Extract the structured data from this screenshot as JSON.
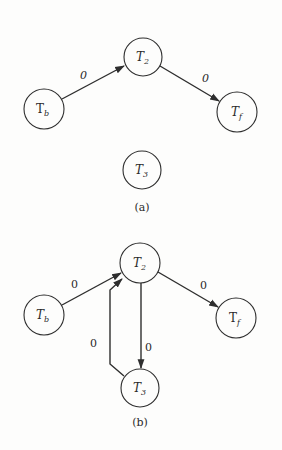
{
  "diagrams": [
    {
      "id": "a",
      "caption": "(a)",
      "nodes": [
        {
          "id": "Tb",
          "base": "T",
          "sub": "b"
        },
        {
          "id": "T2",
          "base": "T",
          "sub": "2"
        },
        {
          "id": "Tf",
          "base": "T",
          "sub": "f"
        },
        {
          "id": "T3",
          "base": "T",
          "sub": "3"
        }
      ],
      "edges": [
        {
          "from": "Tb",
          "to": "T2",
          "label": "0"
        },
        {
          "from": "T2",
          "to": "Tf",
          "label": "0"
        }
      ]
    },
    {
      "id": "b",
      "caption": "(b)",
      "nodes": [
        {
          "id": "Tb",
          "base": "T",
          "sub": "b"
        },
        {
          "id": "T2",
          "base": "T",
          "sub": "2"
        },
        {
          "id": "Tf",
          "base": "T",
          "sub": "f"
        },
        {
          "id": "T3",
          "base": "T",
          "sub": "3"
        }
      ],
      "edges": [
        {
          "from": "Tb",
          "to": "T2",
          "label": "0"
        },
        {
          "from": "T2",
          "to": "Tf",
          "label": "0"
        },
        {
          "from": "T2",
          "to": "T3",
          "label": "0"
        },
        {
          "from": "T3",
          "to": "T2",
          "label": "0"
        }
      ]
    }
  ],
  "colors": {
    "stroke": "#2e2e2e",
    "background": "#fdfdfc"
  }
}
